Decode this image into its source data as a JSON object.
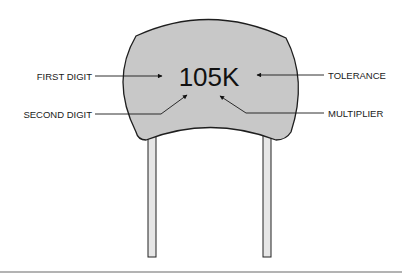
{
  "diagram": {
    "component": "ceramic disc capacitor",
    "code_marking": "105K",
    "labels": {
      "first_digit": "FIRST DIGIT",
      "second_digit": "SECOND DIGIT",
      "tolerance": "TOLERANCE",
      "multiplier": "MULTIPLIER"
    },
    "colors": {
      "body_fill": "#c8c8c8",
      "outline": "#1e1e1e",
      "lead_fill": "#e6e6e6",
      "text": "#111111"
    }
  }
}
